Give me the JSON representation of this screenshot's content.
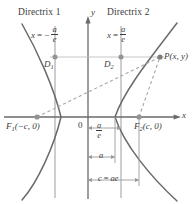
{
  "figure": {
    "type": "hyperbola-directrix-diagram",
    "colors": {
      "curve": "#5a5a5a",
      "axis": "#5a5a5a",
      "directrix": "#9a9a9a",
      "guide": "#b4b4b4",
      "dashed": "#a8a8a8",
      "dot": "#8c8c8c",
      "text": "#3c3c3c",
      "background": "#ffffff"
    }
  },
  "labels": {
    "directrix1_title": "Directrix 1",
    "directrix2_title": "Directrix 2",
    "directrix1_eq_lhs": "x",
    "directrix1_eq_rel": "= −",
    "directrix2_eq_lhs": "x",
    "directrix2_eq_rel": "=",
    "frac_numerator": "a",
    "frac_denominator": "e",
    "point_D1": "D",
    "point_D1_sub": "1",
    "point_D2": "D",
    "point_D2_sub": "2",
    "point_P": "P(x, y)",
    "focus1": "F",
    "focus1_sub": "1",
    "focus1_coords": "(−c, 0)",
    "focus2": "F",
    "focus2_sub": "2",
    "focus2_coords": "(c, 0)",
    "origin": "0",
    "axis_x": "x",
    "axis_y": "y",
    "measure_a": "a",
    "measure_c": "c",
    "measure_c_eq": "=",
    "measure_c_val": "ae"
  },
  "geometry": {
    "origin_x": 88,
    "origin_y": 117,
    "directrix1_x": 55,
    "directrix2_x": 121,
    "focus1_x": 37,
    "focus2_x": 139,
    "vertex_left_x": 61,
    "vertex_right_x": 115,
    "point_P_x": 160,
    "point_P_y": 57,
    "guide_line_y": 57
  }
}
